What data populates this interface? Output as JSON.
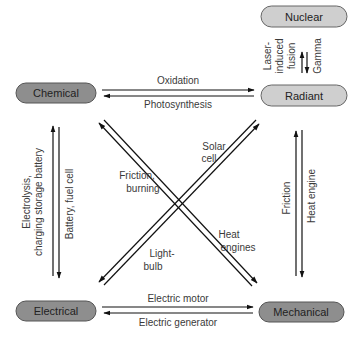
{
  "diagram": {
    "title": "",
    "colors": {
      "dark_node": "#8e8e8e",
      "light_node": "#cfcfcf",
      "node_stroke": "#555555",
      "arrow": "#111111",
      "label": "#3a3a3a"
    },
    "nodes": {
      "nuclear": {
        "label": "Nuclear",
        "style": "light"
      },
      "radiant": {
        "label": "Radiant",
        "style": "light"
      },
      "chemical": {
        "label": "Chemical",
        "style": "dark"
      },
      "electrical": {
        "label": "Electrical",
        "style": "dark"
      },
      "mechanical": {
        "label": "Mechanical",
        "style": "dark"
      }
    },
    "edges": {
      "chemical_to_radiant": {
        "label": "Oxidation",
        "from": "Chemical",
        "to": "Radiant"
      },
      "radiant_to_chemical": {
        "label": "Photosynthesis",
        "from": "Radiant",
        "to": "Chemical"
      },
      "electrical_to_mechanical": {
        "label": "Electric motor",
        "from": "Electrical",
        "to": "Mechanical"
      },
      "mechanical_to_electrical": {
        "label": "Electric generator",
        "from": "Mechanical",
        "to": "Electrical"
      },
      "electrical_to_chemical": {
        "label_line1": "Electrolysis,",
        "label_line2": "charging storage battery",
        "from": "Electrical",
        "to": "Chemical"
      },
      "chemical_to_electrical": {
        "label": "Battery, fuel cell",
        "from": "Chemical",
        "to": "Electrical"
      },
      "mechanical_to_radiant": {
        "label": "Friction",
        "from": "Mechanical",
        "to": "Radiant"
      },
      "radiant_to_mechanical": {
        "label": "Heat engine",
        "from": "Radiant",
        "to": "Mechanical"
      },
      "radiant_to_nuclear": {
        "label_line1": "Laser-",
        "label_line2": "induced",
        "label_line3": "fusion",
        "from": "Radiant",
        "to": "Nuclear"
      },
      "nuclear_to_radiant": {
        "label": "Gamma",
        "from": "Nuclear",
        "to": "Radiant"
      },
      "mechanical_to_chemical": {
        "label_line1": "Friction,",
        "label_line2": "burning",
        "from": "Mechanical",
        "to": "Chemical"
      },
      "chemical_to_mechanical": {
        "label_line1": "Heat",
        "label_line2": "engines",
        "from": "Chemical",
        "to": "Mechanical"
      },
      "electrical_to_radiant_light": {
        "label_line1": "Light-",
        "label_line2": "bulb",
        "from": "Electrical",
        "to": "Radiant"
      },
      "radiant_to_electrical_solar": {
        "label_line1": "Solar",
        "label_line2": "cell",
        "from": "Radiant",
        "to": "Electrical"
      }
    }
  }
}
